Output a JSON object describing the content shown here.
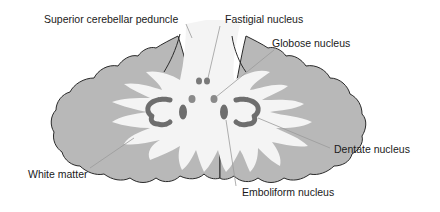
{
  "diagram": {
    "labels": {
      "superior_cerebellar_peduncle": "Superior cerebellar peduncle",
      "fastigial_nucleus": "Fastigial nucleus",
      "globose_nucleus": "Globose nucleus",
      "dentate_nucleus": "Dentate nucleus",
      "white_matter": "White matter",
      "emboliform_nucleus": "Emboliform nucleus"
    },
    "colors": {
      "background": "#ffffff",
      "cortex_gray": "#b8b8b8",
      "white_matter": "#f4f4f4",
      "nucleus_dark": "#6e6e6e",
      "nucleus_mid": "#8a8a8a",
      "outline": "#2a2a2a",
      "leader_line": "#9a9a9a",
      "text": "#1a1a1a"
    }
  }
}
